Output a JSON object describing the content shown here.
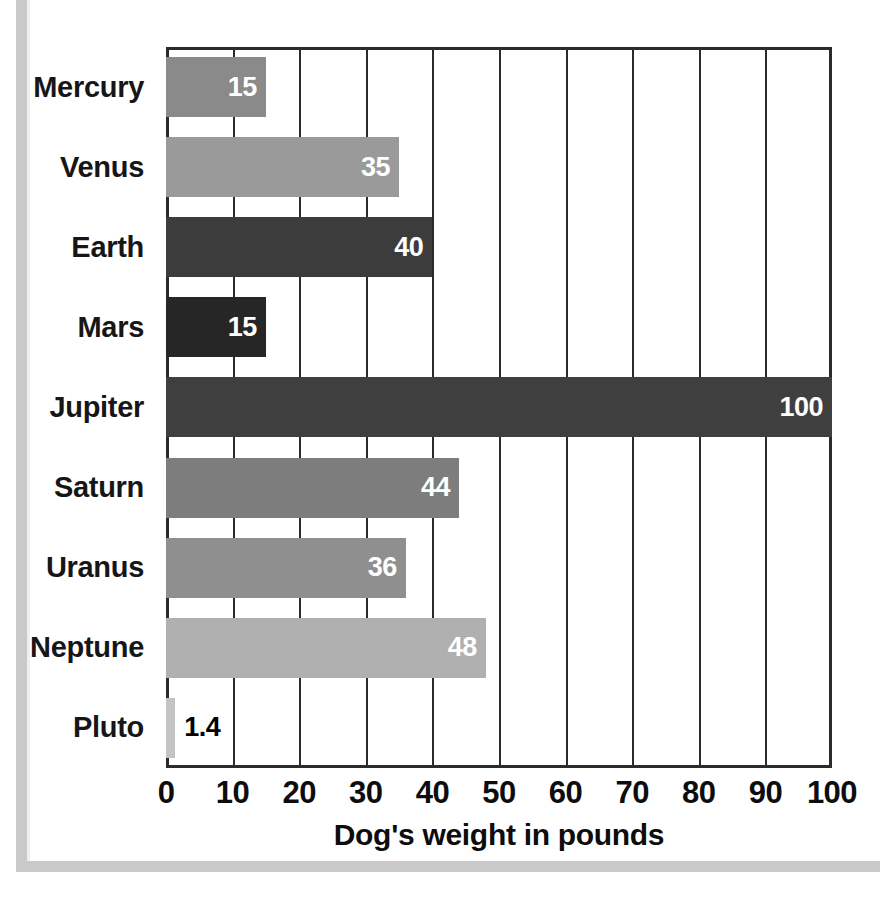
{
  "frame": {
    "border_color": "#c9c9c9",
    "background": "#ffffff"
  },
  "chart_data": {
    "type": "bar",
    "orientation": "horizontal",
    "title": "",
    "subtitle": "",
    "xlabel": "Dog's weight in pounds",
    "ylabel": "",
    "xlim": [
      0,
      100
    ],
    "xticks": [
      0,
      10,
      20,
      30,
      40,
      50,
      60,
      70,
      80,
      90,
      100
    ],
    "xtick_labels": [
      "0",
      "10",
      "20",
      "30",
      "40",
      "50",
      "60",
      "70",
      "80",
      "90",
      "100"
    ],
    "grid": "vertical",
    "legend": "none",
    "categories": [
      "Mercury",
      "Venus",
      "Earth",
      "Mars",
      "Jupiter",
      "Saturn",
      "Uranus",
      "Neptune",
      "Pluto"
    ],
    "values": [
      15,
      35,
      40,
      15,
      100,
      44,
      36,
      48,
      1.4
    ],
    "value_labels": [
      "15",
      "35",
      "40",
      "15",
      "100",
      "44",
      "36",
      "48",
      "1.4"
    ],
    "bar_colors": [
      "#8a8a8a",
      "#9a9a9a",
      "#3c3c3c",
      "#262626",
      "#3f3f3f",
      "#7d7d7d",
      "#8f8f8f",
      "#b0b0b0",
      "#c4c4c4"
    ],
    "label_positions": [
      "inside",
      "inside",
      "inside",
      "inside",
      "inside",
      "inside",
      "inside",
      "inside",
      "outside"
    ],
    "bars": [
      {
        "category": "Mercury",
        "value": 15,
        "label": "15",
        "color": "#8a8a8a",
        "label_position": "inside"
      },
      {
        "category": "Venus",
        "value": 35,
        "label": "35",
        "color": "#9a9a9a",
        "label_position": "inside"
      },
      {
        "category": "Earth",
        "value": 40,
        "label": "40",
        "color": "#3c3c3c",
        "label_position": "inside"
      },
      {
        "category": "Mars",
        "value": 15,
        "label": "15",
        "color": "#262626",
        "label_position": "inside"
      },
      {
        "category": "Jupiter",
        "value": 100,
        "label": "100",
        "color": "#3f3f3f",
        "label_position": "inside"
      },
      {
        "category": "Saturn",
        "value": 44,
        "label": "44",
        "color": "#7d7d7d",
        "label_position": "inside"
      },
      {
        "category": "Uranus",
        "value": 36,
        "label": "36",
        "color": "#8f8f8f",
        "label_position": "inside"
      },
      {
        "category": "Neptune",
        "value": 48,
        "label": "48",
        "color": "#b0b0b0",
        "label_position": "inside"
      },
      {
        "category": "Pluto",
        "value": 1.4,
        "label": "1.4",
        "color": "#c4c4c4",
        "label_position": "outside"
      }
    ]
  },
  "axis": {
    "line_color": "#2b2b2b",
    "grid_color": "#2b2b2b"
  }
}
